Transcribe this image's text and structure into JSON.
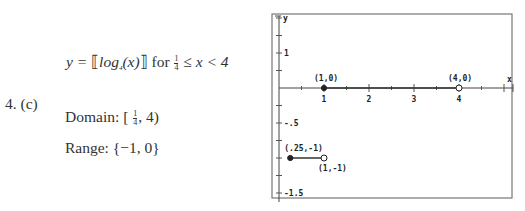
{
  "problem_label": "4. (c)",
  "equation": {
    "lhs": "y = ",
    "func_open": "⟦",
    "func": "log",
    "base": "4",
    "arg": "(x)",
    "func_close": "⟧",
    "for_word": " for ",
    "lower_num": "1",
    "lower_den": "4",
    "condition": " ≤ x < 4"
  },
  "domain": {
    "label": "Domain: ",
    "open": "[ ",
    "lower_num": "1",
    "lower_den": "4",
    "rest": ", 4)"
  },
  "range": {
    "label": "Range:  ",
    "value": "{−1, 0}"
  },
  "chart_data": {
    "type": "line",
    "title": "",
    "xlabel": "x",
    "ylabel": "y",
    "xlim": [
      0,
      5.2
    ],
    "ylim": [
      -1.65,
      1.25
    ],
    "x_tick_labels": [
      "1",
      "2",
      "3",
      "4"
    ],
    "x_ticks": [
      1,
      2,
      3,
      4
    ],
    "y_tick_labels": [
      {
        "value": 0.5,
        "label": "1"
      },
      {
        "value": -0.5,
        "label": "-.5"
      },
      {
        "value": -1.5,
        "label": "-1.5"
      }
    ],
    "y_minor_step": 0.25,
    "x_minor_step": 0.5,
    "grid": false,
    "series": [
      {
        "name": "y = -1",
        "x": [
          0.25,
          1
        ],
        "y": [
          -1,
          -1
        ],
        "start_closed": true,
        "end_closed": false
      },
      {
        "name": "y = 0",
        "x": [
          1,
          4
        ],
        "y": [
          0,
          0
        ],
        "start_closed": true,
        "end_closed": false
      }
    ],
    "annotations": [
      {
        "text": "(1,0)",
        "x": 1,
        "y": 0
      },
      {
        "text": "(4,0)",
        "x": 4,
        "y": 0
      },
      {
        "text": "(.25,-1)",
        "x": 0.25,
        "y": -1
      },
      {
        "text": "(1,-1)",
        "x": 1,
        "y": -1
      }
    ]
  }
}
